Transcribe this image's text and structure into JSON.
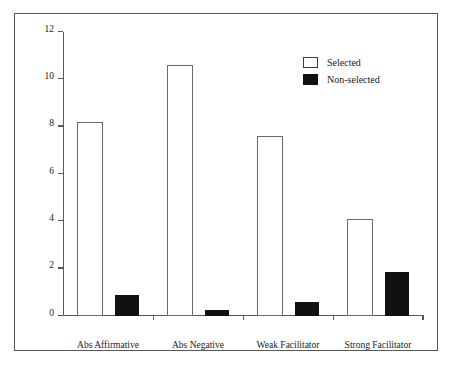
{
  "page_header": "",
  "legend": {
    "position": "top-right",
    "entries": [
      {
        "label": "Selected",
        "swatch": "open-box",
        "color": "#ffffff"
      },
      {
        "label": "Non-selected",
        "swatch": "filled-box",
        "color": "#111111"
      }
    ]
  },
  "chart_data": {
    "type": "bar",
    "title": "",
    "xlabel": "",
    "ylabel": "",
    "ylim": [
      0,
      12
    ],
    "yticks": [
      0,
      2,
      4,
      6,
      8,
      10,
      12
    ],
    "ytick_labels": [
      "0",
      "2",
      "4",
      "6",
      "8",
      "10",
      "12"
    ],
    "grid": false,
    "legend_position": "top-right",
    "categories": [
      "Abs Affirmative",
      "Abs Negative",
      "Weak Facilitator",
      "Strong Facilitator"
    ],
    "series": [
      {
        "name": "Selected",
        "color": "#ffffff",
        "edge_color": "#6a6a6a",
        "values": [
          8.2,
          10.6,
          7.6,
          4.1
        ]
      },
      {
        "name": "Non-selected",
        "color": "#111111",
        "edge_color": "#111111",
        "values": [
          0.9,
          0.25,
          0.6,
          1.85
        ]
      }
    ]
  }
}
